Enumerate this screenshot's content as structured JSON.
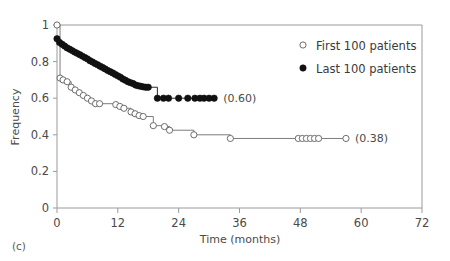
{
  "panel_label": "(c)",
  "axes": {
    "x_title": "Time (months)",
    "y_title": "Frequency",
    "x_ticks": [
      0,
      12,
      24,
      36,
      48,
      60,
      72
    ],
    "y_ticks": [
      "0",
      "0.2",
      "0.4",
      "0.6",
      "0.8",
      "1"
    ]
  },
  "legend": {
    "items": [
      {
        "label": "First 100 patients",
        "marker": "open-circle"
      },
      {
        "label": "Last 100 patients",
        "marker": "filled-circle"
      }
    ]
  },
  "annotations": [
    {
      "text": "(0.60)",
      "series": "last-100"
    },
    {
      "text": "(0.38)",
      "series": "first-100"
    }
  ],
  "chart_data": {
    "type": "line",
    "title": "",
    "xlabel": "Time (months)",
    "ylabel": "Frequency",
    "xlim": [
      0,
      72
    ],
    "ylim": [
      0,
      1
    ],
    "xticks": [
      0,
      12,
      24,
      36,
      48,
      60,
      72
    ],
    "yticks": [
      0,
      0.2,
      0.4,
      0.6,
      0.8,
      1
    ],
    "grid": false,
    "legend_position": "top-right",
    "step_style": "post",
    "series": [
      {
        "name": "First 100 patients",
        "marker": "open-circle",
        "color": "#5d5d5d",
        "final_value": 0.38,
        "final_label": "(0.38)",
        "x": [
          0,
          0.6,
          1.2,
          2.0,
          2.8,
          3.6,
          4.4,
          5.2,
          6.0,
          6.8,
          7.6,
          8.4,
          11.6,
          12.4,
          13.2,
          14.6,
          15.4,
          16.2,
          17.0,
          19.0,
          21.2,
          22.2,
          27.0,
          34.2,
          47.6,
          48.4,
          49.2,
          50.0,
          50.8,
          51.6,
          57.0
        ],
        "y": [
          1.0,
          0.71,
          0.7,
          0.69,
          0.66,
          0.645,
          0.63,
          0.615,
          0.6,
          0.585,
          0.57,
          0.57,
          0.565,
          0.555,
          0.545,
          0.525,
          0.515,
          0.505,
          0.5,
          0.45,
          0.445,
          0.425,
          0.4,
          0.38,
          0.38,
          0.38,
          0.38,
          0.38,
          0.38,
          0.38,
          0.38
        ]
      },
      {
        "name": "Last 100 patients",
        "marker": "filled-circle",
        "color": "#111111",
        "final_value": 0.6,
        "final_label": "(0.60)",
        "x": [
          0,
          0.5,
          1.0,
          1.5,
          2.0,
          2.5,
          3.0,
          3.5,
          4.0,
          4.5,
          5.0,
          5.5,
          6.0,
          6.5,
          7.0,
          7.5,
          8.0,
          8.5,
          9.0,
          9.5,
          10.0,
          10.5,
          11.0,
          11.5,
          12.0,
          12.5,
          13.0,
          13.5,
          14.0,
          14.5,
          15.0,
          15.5,
          16.0,
          16.5,
          17.0,
          17.5,
          18.0,
          19.8,
          21.0,
          22.0,
          24.0,
          25.8,
          27.2,
          28.2,
          29.0,
          30.0,
          31.0
        ],
        "y": [
          0.925,
          0.905,
          0.895,
          0.885,
          0.875,
          0.868,
          0.86,
          0.852,
          0.845,
          0.838,
          0.83,
          0.822,
          0.815,
          0.805,
          0.798,
          0.79,
          0.783,
          0.775,
          0.768,
          0.76,
          0.752,
          0.745,
          0.738,
          0.73,
          0.722,
          0.715,
          0.705,
          0.698,
          0.69,
          0.685,
          0.68,
          0.672,
          0.668,
          0.665,
          0.662,
          0.66,
          0.66,
          0.6,
          0.6,
          0.6,
          0.6,
          0.6,
          0.6,
          0.6,
          0.6,
          0.6,
          0.6
        ]
      }
    ]
  }
}
